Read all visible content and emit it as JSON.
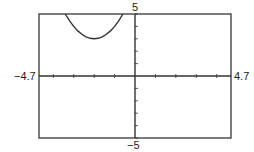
{
  "chart_data": {
    "type": "line",
    "title": "",
    "xlabel": "",
    "ylabel": "",
    "xlim": [
      -4.7,
      4.7
    ],
    "ylim": [
      -5,
      5
    ],
    "x_tick_step": 1,
    "y_tick_step": 1,
    "grid": false,
    "tick_labels": {
      "xmin": "−4.7",
      "xmax": "4.7",
      "ymin": "−5",
      "ymax": "5"
    },
    "series": [
      {
        "name": "f(x) = (x + 2)^2 + 3",
        "function": "(x+2)^2+3",
        "vertex": [
          -2,
          3
        ],
        "x": [
          -3.41,
          -3.2,
          -3.0,
          -2.8,
          -2.6,
          -2.4,
          -2.2,
          -2.0,
          -1.8,
          -1.6,
          -1.4,
          -1.2,
          -1.0,
          -0.8,
          -0.59
        ],
        "values": [
          5.0,
          4.44,
          4.0,
          3.64,
          3.36,
          3.16,
          3.04,
          3.0,
          3.04,
          3.16,
          3.36,
          3.64,
          4.0,
          4.44,
          5.0
        ],
        "color": "#333333"
      }
    ]
  }
}
